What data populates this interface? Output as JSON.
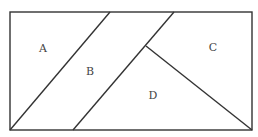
{
  "diagram": {
    "type": "rectangle partition",
    "rectangle": {
      "x": 10,
      "y": 12,
      "width": 242,
      "height": 118
    },
    "lines": [
      {
        "name": "line-a-b",
        "x1": 10,
        "y1": 130,
        "x2": 110,
        "y2": 12
      },
      {
        "name": "line-b-d",
        "x1": 73,
        "y1": 130,
        "x2": 174,
        "y2": 12
      },
      {
        "name": "line-c-d",
        "x1": 146,
        "y1": 46,
        "x2": 252,
        "y2": 130
      }
    ],
    "regions": [
      {
        "label": "A",
        "x": 43,
        "y": 52
      },
      {
        "label": "B",
        "x": 90,
        "y": 75
      },
      {
        "label": "C",
        "x": 213,
        "y": 51
      },
      {
        "label": "D",
        "x": 153,
        "y": 99
      }
    ],
    "stroke_color": "#333333"
  }
}
